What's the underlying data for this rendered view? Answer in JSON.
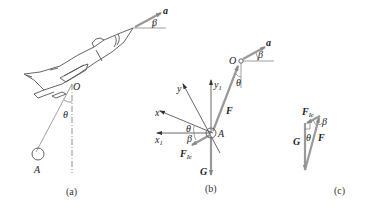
{
  "figure": {
    "panels": [
      {
        "id": "a",
        "caption": "(a)",
        "labels": {
          "accel": "a",
          "beta": "β",
          "pivot": "O",
          "theta": "θ",
          "bob": "A"
        }
      },
      {
        "id": "b",
        "caption": "(b)",
        "labels": {
          "accel": "a",
          "beta": "β",
          "pivot": "O",
          "theta_top": "θ",
          "y1": "y",
          "y1_sub": "1",
          "y": "y",
          "x": "x",
          "x1": "x",
          "x1_sub": "1",
          "theta": "θ",
          "beta2": "β",
          "point": "A",
          "force_F": "F",
          "force_FIe": "F",
          "force_FIe_sub": "Ie",
          "gravity": "G"
        }
      },
      {
        "id": "c",
        "caption": "(c)",
        "labels": {
          "force_FIe": "F",
          "force_FIe_sub": "Ie",
          "beta": "β",
          "gravity": "G",
          "theta": "θ",
          "force_F": "F"
        }
      }
    ]
  },
  "colors": {
    "vector": "#999999",
    "line": "#555555",
    "text": "#222222"
  }
}
